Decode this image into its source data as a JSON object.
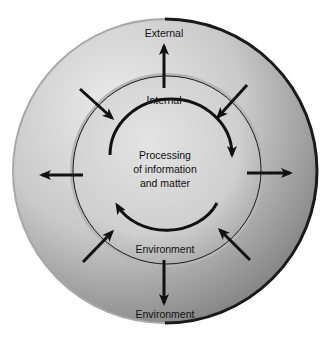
{
  "diagram": {
    "type": "concentric-system-flow",
    "outer_ring": {
      "top_label": "External",
      "bottom_label": "Environment"
    },
    "inner_circle": {
      "top_label": "Internal",
      "bottom_label": "Environment"
    },
    "center": {
      "line1": "Processing",
      "line2": "of information",
      "line3": "and matter"
    },
    "arrows": {
      "inward": [
        "top-left",
        "top-right",
        "bottom-left",
        "bottom-right"
      ],
      "outward": [
        "top",
        "left",
        "right",
        "bottom"
      ],
      "cycle": [
        "top-arc-clockwise",
        "bottom-arc-clockwise"
      ]
    },
    "colors": {
      "outer_fill_light": "#e6e6e6",
      "outer_fill_dark": "#8f8f8f",
      "inner_fill": "#d4d4d4",
      "arrow": "#111111"
    }
  }
}
